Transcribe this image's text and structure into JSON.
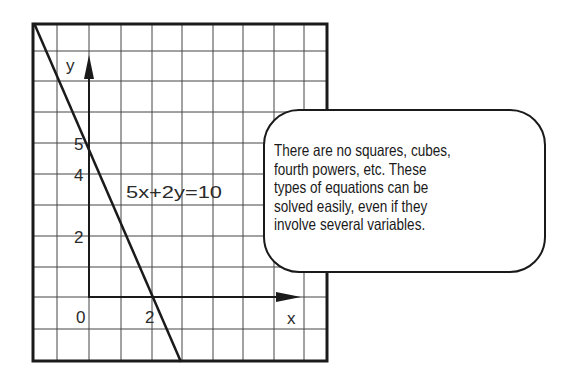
{
  "figure": {
    "equation": "5x+2y=10",
    "axes": {
      "x_label": "x",
      "y_label": "y",
      "x_ticks": [
        {
          "value": 0,
          "label": "0"
        },
        {
          "value": 2,
          "label": "2"
        }
      ],
      "y_ticks": [
        {
          "value": 2,
          "label": "2"
        },
        {
          "value": 4,
          "label": "4"
        },
        {
          "value": 5,
          "label": "5"
        }
      ]
    },
    "line": {
      "x_intercept": 2,
      "y_intercept": 5,
      "slope": -2.5
    }
  },
  "callout": {
    "lines": [
      "There are no squares, cubes,",
      "fourth powers, etc. These",
      "types of equations can be",
      "solved easily, even if they",
      "involve several variables."
    ]
  },
  "colors": {
    "ink": "#1a1a1a",
    "grid": "#3a3a3a",
    "background": "#ffffff"
  }
}
